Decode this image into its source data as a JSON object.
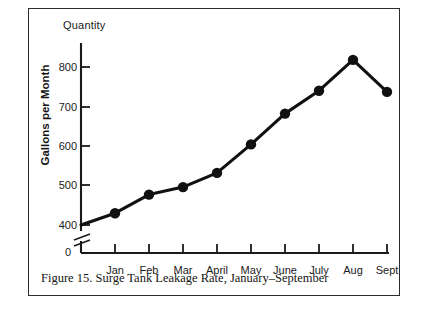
{
  "figure": {
    "caption": "Figure 15. Surge Tank Leakage Rate, January–September",
    "axis_title_top": "Quantity",
    "ylabel": "Gallons per Month",
    "zero_label": "0",
    "line_color": "#111111",
    "marker_color": "#111111",
    "axis_color": "#1a1a1a",
    "background": "#ffffff",
    "border_color": "#2b2b2b",
    "axis_break": "broken-axis-symbol"
  },
  "chart_data": {
    "type": "line",
    "title": "Figure 15. Surge Tank Leakage Rate, January–September",
    "subtitle": "Quantity",
    "xlabel": "",
    "ylabel": "Gallons per Month",
    "categories": [
      "Jan",
      "Feb",
      "Mar",
      "April",
      "May",
      "June",
      "July",
      "Aug",
      "Sept"
    ],
    "values": [
      430,
      477,
      496,
      532,
      604,
      682,
      740,
      818,
      737
    ],
    "series": [
      {
        "name": "Surge Tank Leakage Rate",
        "values": [
          430,
          477,
          496,
          532,
          604,
          682,
          740,
          818,
          737
        ]
      }
    ],
    "ylim": [
      400,
      860
    ],
    "yticks": [
      400,
      500,
      600,
      700,
      800
    ],
    "ytick_labels": [
      "400",
      "500",
      "600",
      "700",
      "800"
    ],
    "axis_break_below": 400,
    "zero_tick_label": "0",
    "grid": false,
    "legend": false,
    "markers": "filled-circle",
    "units": "gallons per month"
  }
}
